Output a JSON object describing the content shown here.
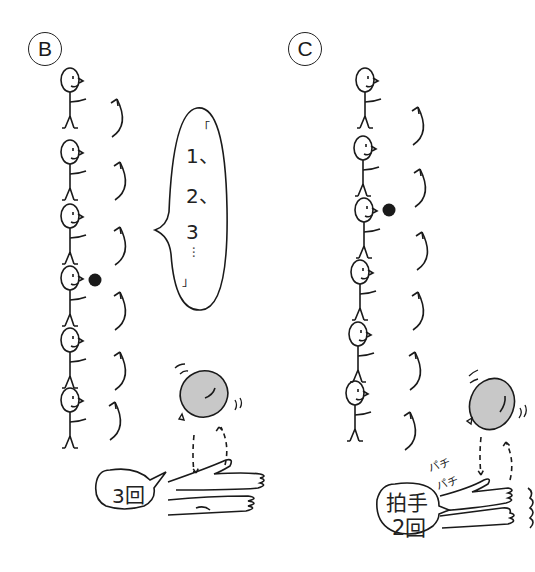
{
  "panels": [
    {
      "label": "B",
      "people_count": 6,
      "ball_holder_index": 3,
      "speech": {
        "open_quote": "「",
        "lines": [
          "1、",
          "2、",
          "3",
          "…"
        ],
        "close_quote": "」"
      },
      "balloon_action": {
        "count_label": "3回"
      }
    },
    {
      "label": "C",
      "people_count": 6,
      "ball_holder_index": 2,
      "balloon_action": {
        "clap_label_line1": "拍手",
        "clap_label_line2": "2回",
        "sound_effect_1": "パチ",
        "sound_effect_2": "パチ"
      }
    }
  ],
  "colors": {
    "ink": "#1a1a1a",
    "balloon_fill": "#c8c8c8",
    "background": "#ffffff"
  }
}
